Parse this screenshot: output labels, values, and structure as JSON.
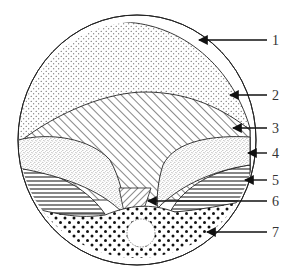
{
  "diagram": {
    "type": "labeled cross-section",
    "colors": {
      "ink": "#222222",
      "background": "#ffffff"
    },
    "callouts": [
      {
        "id": "1",
        "label": "1",
        "region": "outer-layer"
      },
      {
        "id": "2",
        "label": "2",
        "region": "fine-dotted-layer"
      },
      {
        "id": "3",
        "label": "3",
        "region": "diagonal-hatched-layer"
      },
      {
        "id": "4",
        "label": "4",
        "region": "stippled-lobes"
      },
      {
        "id": "5",
        "label": "5",
        "region": "horizontal-hatched-layer"
      },
      {
        "id": "6",
        "label": "6",
        "region": "central-cross-hatched-wedge"
      },
      {
        "id": "7",
        "label": "7",
        "region": "coarse-dotted-base-with-hole"
      }
    ]
  }
}
